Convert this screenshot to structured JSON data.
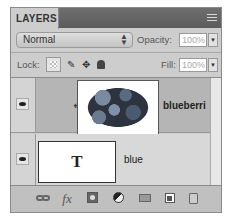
{
  "panel": {
    "tab_label": "LAYERS",
    "menu_icon": "panel-menu-icon"
  },
  "blend": {
    "mode": "Normal",
    "opacity_label": "Opacity:",
    "opacity_value": "100%",
    "fill_label": "Fill:",
    "fill_value": "100%"
  },
  "lock": {
    "label": "Lock:",
    "buttons": [
      "lock-transparent-pixels-icon",
      "lock-image-pixels-icon",
      "lock-position-icon",
      "lock-all-icon"
    ]
  },
  "layers": [
    {
      "name": "blueberri",
      "type": "image",
      "visible": true,
      "selected": true,
      "clipped": true,
      "clip_glyph": "↲"
    },
    {
      "name": "blue",
      "type": "text",
      "visible": true,
      "selected": false,
      "thumb_glyph": "T"
    }
  ],
  "bottom_bar": {
    "icons": [
      "link-layers-icon",
      "fx-icon",
      "add-mask-icon",
      "adjustment-layer-icon",
      "new-group-icon",
      "new-layer-icon",
      "delete-icon"
    ],
    "fx_glyph": "fx"
  }
}
